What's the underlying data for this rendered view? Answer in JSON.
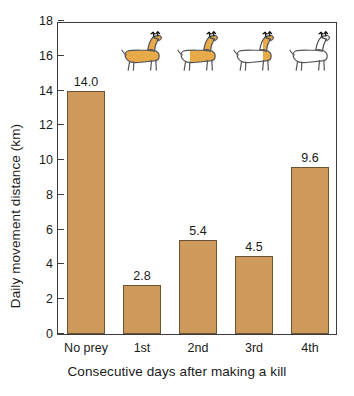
{
  "chart_data": {
    "type": "bar",
    "title": "",
    "xlabel": "Consecutive days after making a kill",
    "ylabel": "Daily movement distance (km)",
    "categories": [
      "No prey",
      "1st",
      "2nd",
      "3rd",
      "4th"
    ],
    "values": [
      14.0,
      2.8,
      5.4,
      4.5,
      9.6
    ],
    "value_labels": [
      "14.0",
      "2.8",
      "5.4",
      "4.5",
      "9.6"
    ],
    "ylim": [
      0,
      18
    ],
    "yticks": [
      0,
      2,
      4,
      6,
      8,
      10,
      12,
      14,
      16,
      18
    ],
    "ytick_labels": [
      "0",
      "2",
      "4",
      "6",
      "8",
      "10",
      "12",
      "14",
      "16",
      "18"
    ],
    "grid": false,
    "legend": null,
    "bar_color": "#cd9a5b",
    "bar_edge_color": "#6b5233",
    "axis_color": "#3d3d3d",
    "annotations": [
      {
        "name": "deer-icon-full",
        "above_category": "1st",
        "description": "deer silhouette fully filled orange",
        "fill_fraction": 1.0
      },
      {
        "name": "deer-icon-three-quarter",
        "above_category": "2nd",
        "description": "deer silhouette with hindquarters and rear legs unfilled",
        "fill_fraction": 0.7
      },
      {
        "name": "deer-icon-quarter",
        "above_category": "3rd",
        "description": "deer silhouette with only neck and shoulder filled orange",
        "fill_fraction": 0.3
      },
      {
        "name": "deer-icon-empty",
        "above_category": "4th",
        "description": "deer silhouette entirely unfilled outline",
        "fill_fraction": 0.0
      }
    ]
  }
}
